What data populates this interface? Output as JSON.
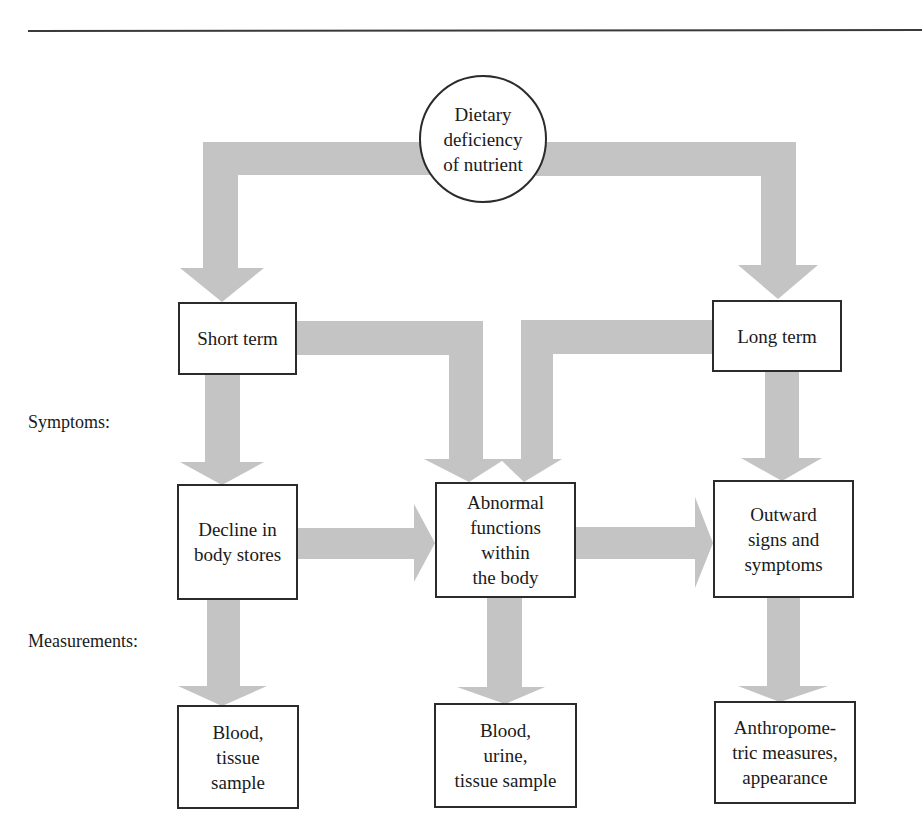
{
  "diagram": {
    "type": "flowchart",
    "colors": {
      "arrow": "#c4c4c4",
      "border": "#2b2b2b",
      "background": "#ffffff"
    },
    "source": {
      "label_lines": [
        "Dietary",
        "deficiency",
        "of nutrient"
      ]
    },
    "nodes": {
      "short_term": {
        "label": "Short term"
      },
      "long_term": {
        "label": "Long term"
      },
      "decline": {
        "label_lines": [
          "Decline in",
          "body stores"
        ]
      },
      "abnormal": {
        "label_lines": [
          "Abnormal",
          "functions",
          "within",
          "the body"
        ]
      },
      "outward": {
        "label_lines": [
          "Outward",
          "signs and",
          "symptoms"
        ]
      },
      "measure_left": {
        "label_lines": [
          "Blood,",
          "tissue",
          "sample"
        ]
      },
      "measure_middle": {
        "label_lines": [
          "Blood,",
          "urine,",
          "tissue sample"
        ]
      },
      "measure_right": {
        "label_lines": [
          "Anthropome-",
          "tric measures,",
          "appearance"
        ]
      }
    },
    "row_labels": {
      "symptoms": "Symptoms:",
      "measurements": "Measurements:"
    },
    "edges": [
      {
        "from": "Dietary deficiency of nutrient",
        "to": "Short term"
      },
      {
        "from": "Dietary deficiency of nutrient",
        "to": "Long term"
      },
      {
        "from": "Short term",
        "to": "Decline in body stores"
      },
      {
        "from": "Short term",
        "to": "Abnormal functions within the body"
      },
      {
        "from": "Long term",
        "to": "Abnormal functions within the body"
      },
      {
        "from": "Long term",
        "to": "Outward signs and symptoms"
      },
      {
        "from": "Decline in body stores",
        "to": "Abnormal functions within the body"
      },
      {
        "from": "Abnormal functions within the body",
        "to": "Outward signs and symptoms"
      },
      {
        "from": "Decline in body stores",
        "to": "Blood, tissue sample"
      },
      {
        "from": "Abnormal functions within the body",
        "to": "Blood, urine, tissue sample"
      },
      {
        "from": "Outward signs and symptoms",
        "to": "Anthropometric measures, appearance"
      }
    ]
  }
}
